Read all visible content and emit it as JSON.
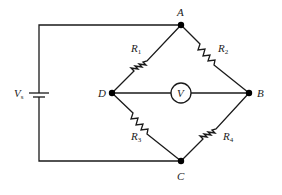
{
  "diagram": {
    "type": "wheatstone-bridge",
    "nodes": [
      {
        "id": "A",
        "label": "A"
      },
      {
        "id": "B",
        "label": "B"
      },
      {
        "id": "C",
        "label": "C"
      },
      {
        "id": "D",
        "label": "D"
      }
    ],
    "resistors": [
      {
        "id": "R1",
        "label": "R",
        "sub": "1",
        "between": [
          "D",
          "A"
        ]
      },
      {
        "id": "R2",
        "label": "R",
        "sub": "2",
        "between": [
          "A",
          "B"
        ]
      },
      {
        "id": "R3",
        "label": "R",
        "sub": "3",
        "between": [
          "D",
          "C"
        ]
      },
      {
        "id": "R4",
        "label": "R",
        "sub": "4",
        "between": [
          "C",
          "B"
        ]
      }
    ],
    "meter": {
      "label": "V",
      "between": [
        "D",
        "B"
      ]
    },
    "source": {
      "label": "V",
      "sub": "s",
      "between": [
        "A",
        "C"
      ]
    }
  }
}
